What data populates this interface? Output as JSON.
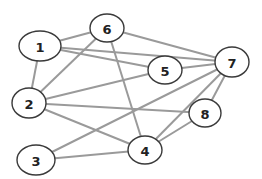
{
  "diagram": {
    "type": "undirected-graph",
    "nodes": [
      {
        "id": "1",
        "label": "1",
        "x": 40,
        "y": 46,
        "rx": 21,
        "ry": 15
      },
      {
        "id": "6",
        "label": "6",
        "x": 107,
        "y": 28,
        "rx": 17,
        "ry": 14
      },
      {
        "id": "5",
        "label": "5",
        "x": 165,
        "y": 70,
        "rx": 17,
        "ry": 14
      },
      {
        "id": "7",
        "label": "7",
        "x": 232,
        "y": 62,
        "rx": 17,
        "ry": 15
      },
      {
        "id": "2",
        "label": "2",
        "x": 29,
        "y": 103,
        "rx": 17,
        "ry": 15
      },
      {
        "id": "8",
        "label": "8",
        "x": 205,
        "y": 113,
        "rx": 16,
        "ry": 14
      },
      {
        "id": "3",
        "label": "3",
        "x": 36,
        "y": 160,
        "rx": 19,
        "ry": 15
      },
      {
        "id": "4",
        "label": "4",
        "x": 145,
        "y": 150,
        "rx": 17,
        "ry": 14
      }
    ],
    "edges": [
      {
        "from": "1",
        "to": "6"
      },
      {
        "from": "1",
        "to": "7"
      },
      {
        "from": "1",
        "to": "5"
      },
      {
        "from": "1",
        "to": "2"
      },
      {
        "from": "6",
        "to": "7"
      },
      {
        "from": "6",
        "to": "2"
      },
      {
        "from": "6",
        "to": "4"
      },
      {
        "from": "5",
        "to": "7"
      },
      {
        "from": "5",
        "to": "2"
      },
      {
        "from": "2",
        "to": "8"
      },
      {
        "from": "2",
        "to": "4"
      },
      {
        "from": "7",
        "to": "3"
      },
      {
        "from": "7",
        "to": "4"
      },
      {
        "from": "7",
        "to": "8"
      },
      {
        "from": "3",
        "to": "4"
      },
      {
        "from": "4",
        "to": "8"
      }
    ],
    "colors": {
      "edge": "#9a9a9a",
      "node_stroke": "#3a3a3a",
      "node_fill": "#ffffff",
      "label": "#222222"
    }
  }
}
